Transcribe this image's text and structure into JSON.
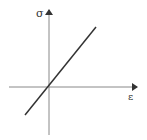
{
  "diagram": {
    "type": "stress-strain linear plot",
    "y_axis": {
      "label": "σ"
    },
    "x_axis": {
      "label": "ε"
    },
    "line": {
      "description": "straight line through origin, positive slope"
    },
    "colors": {
      "axis": "#888888",
      "line": "#333333",
      "label": "#333333"
    }
  }
}
